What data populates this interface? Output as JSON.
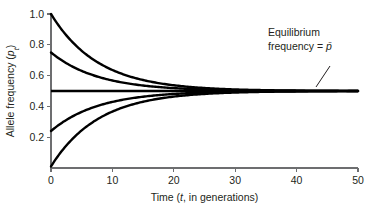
{
  "chart_data": {
    "type": "line",
    "title": "",
    "xlabel": "Time (t, in generations)",
    "xlabel_parts": {
      "pre": "Time (",
      "italic": "t",
      "post": ", in generations)"
    },
    "ylabel": "Allele frequency (pₜ)",
    "ylabel_parts": {
      "pre": "Allele frequency (",
      "italic": "p",
      "sub": "t",
      "post": ")"
    },
    "xlim": [
      0,
      50
    ],
    "ylim": [
      0,
      1.0
    ],
    "xticks": [
      0,
      10,
      20,
      30,
      40,
      50
    ],
    "xtick_labels": [
      "0",
      "10",
      "20",
      "30",
      "40",
      "50"
    ],
    "yticks": [
      0.2,
      0.4,
      0.6,
      0.8,
      1.0
    ],
    "ytick_labels": [
      "0.2",
      "0.4",
      "0.6",
      "0.8",
      "1.0"
    ],
    "grid": false,
    "legend": false,
    "equilibrium_value": 0.5,
    "convergence_rate": 0.13,
    "x_sample_step": 0.25,
    "series": [
      {
        "name": "p0 = 1.00",
        "start": 1.0,
        "equilibrium": 0.5
      },
      {
        "name": "p0 = 0.75",
        "start": 0.75,
        "equilibrium": 0.5
      },
      {
        "name": "p0 = 0.50",
        "start": 0.5,
        "equilibrium": 0.5
      },
      {
        "name": "p0 = 0.24",
        "start": 0.24,
        "equilibrium": 0.5
      },
      {
        "name": "p0 = 0.01",
        "start": 0.01,
        "equilibrium": 0.5
      }
    ],
    "annotations": [
      {
        "id": "equilibrium-callout",
        "line1": "Equilibrium",
        "line2_pre": "frequency = ",
        "line2_symbol": "p",
        "line2_overbar": true,
        "text_x": 268,
        "text_y": 36,
        "leader": {
          "x1": 330,
          "y1": 66,
          "x2": 316,
          "y2": 87
        }
      }
    ]
  },
  "colors": {
    "curve": "#000000",
    "axis": "#6d6e70",
    "text": "#231f20",
    "background": "#ffffff"
  },
  "geometry": {
    "plot_left": 51,
    "plot_right": 358,
    "plot_top": 14,
    "plot_bottom": 168
  }
}
